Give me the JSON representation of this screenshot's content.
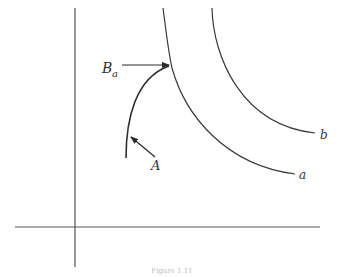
{
  "figure": {
    "caption": "Figure 1.11",
    "labels": {
      "curve_a": "a",
      "curve_b": "b",
      "point_A": "A",
      "point_B_main": "B",
      "point_B_sub": "a"
    },
    "colors": {
      "stroke": "#3a3a3a",
      "axis": "#555555"
    }
  }
}
